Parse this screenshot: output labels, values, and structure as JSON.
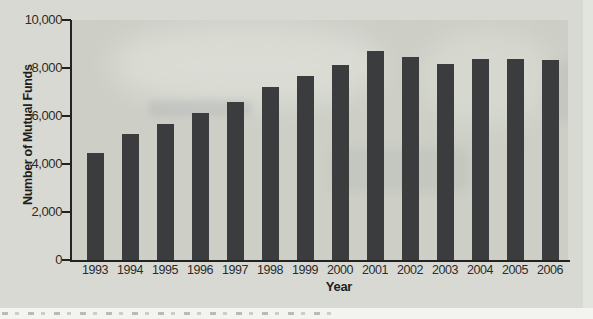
{
  "figure": {
    "background_color": "#d8d9d3",
    "plot_background_color": "#cdcfc7",
    "bar_color": "#3a3c3d",
    "axis_color": "#222222",
    "label_color": "#2b2b2b",
    "caption_strip_color": "#f3f3ef"
  },
  "chart_data": {
    "type": "bar",
    "title": "",
    "xlabel": "Year",
    "ylabel": "Number of Mutual Funds",
    "categories": [
      "1993",
      "1994",
      "1995",
      "1996",
      "1997",
      "1998",
      "1999",
      "2000",
      "2001",
      "2002",
      "2003",
      "2004",
      "2005",
      "2006"
    ],
    "values": [
      4450,
      5240,
      5670,
      6110,
      6600,
      7220,
      7680,
      8130,
      8690,
      8440,
      8150,
      8360,
      8380,
      8330
    ],
    "ylim": [
      0,
      10000
    ],
    "ytick_interval": 2000,
    "ytick_labels": [
      "0",
      "2,000",
      "4,000",
      "6,000",
      "8,000",
      "10,000"
    ],
    "grid": false,
    "legend": "none"
  }
}
